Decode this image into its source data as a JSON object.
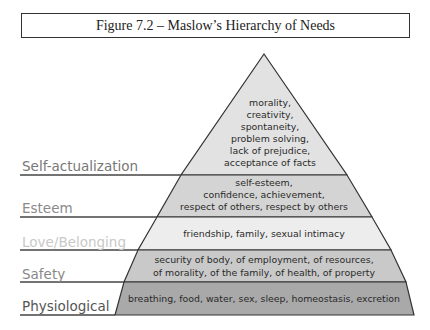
{
  "caption": "Figure 7.2 – Maslow’s Hierarchy of Needs",
  "pyramid": {
    "levels": [
      {
        "label": "Self-actualization",
        "label_color": "#777777",
        "fill": "#e2e2e2",
        "lines": [
          "morality,",
          "creativity,",
          "spontaneity,",
          "problem solving,",
          "lack of prejudice,",
          "acceptance of facts"
        ]
      },
      {
        "label": "Esteem",
        "label_color": "#8a8a8a",
        "fill": "#d4d4d4",
        "lines": [
          "self-esteem,",
          "confidence, achievement,",
          "respect of others, respect by others"
        ]
      },
      {
        "label": "Love/Belonging",
        "label_color": "#c8c8c8",
        "fill": "#ededed",
        "lines": [
          "friendship, family, sexual intimacy"
        ]
      },
      {
        "label": "Safety",
        "label_color": "#888888",
        "fill": "#c9c9c9",
        "lines": [
          "security of body, of employment, of resources,",
          "of morality, of the family, of health, of property"
        ]
      },
      {
        "label": "Physiological",
        "label_color": "#555555",
        "fill": "#a9a9a9",
        "lines": [
          "breathing, food, water, sex, sleep, homeostasis, excretion"
        ]
      }
    ]
  }
}
